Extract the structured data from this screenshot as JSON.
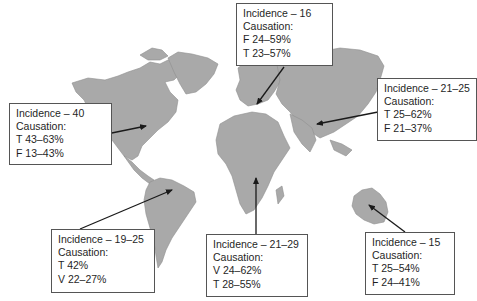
{
  "colors": {
    "land": "#a9a9a9",
    "border": "#555555",
    "arrow": "#1a1a1a",
    "background": "#ffffff"
  },
  "regions": [
    {
      "id": "north-america",
      "incidence": "Incidence – 40",
      "causation_label": "Causation:",
      "lines": [
        "T 43–63%",
        "F 13–43%"
      ]
    },
    {
      "id": "europe",
      "incidence": "Incidence – 16",
      "causation_label": "Causation:",
      "lines": [
        "F 24–59%",
        "T 23–57%"
      ]
    },
    {
      "id": "asia",
      "incidence": "Incidence – 21–25",
      "causation_label": "Causation:",
      "lines": [
        "T 25–62%",
        "F 21–37%"
      ]
    },
    {
      "id": "south-america",
      "incidence": "Incidence – 19–25",
      "causation_label": "Causation:",
      "lines": [
        "T 42%",
        "V 22–27%"
      ]
    },
    {
      "id": "africa",
      "incidence": "Incidence – 21–29",
      "causation_label": "Causation:",
      "lines": [
        "V 24–62%",
        "T 28–55%"
      ]
    },
    {
      "id": "australia",
      "incidence": "Incidence – 15",
      "causation_label": "Causation:",
      "lines": [
        "T 25–54%",
        "F 24–41%"
      ]
    }
  ]
}
